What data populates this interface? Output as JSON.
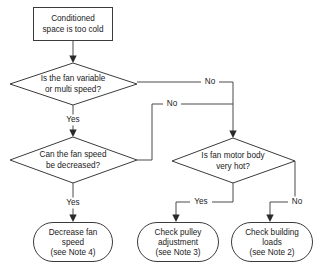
{
  "diagram": {
    "colors": {
      "background": "#ffffff",
      "shape_fill": "#ffffff",
      "shape_stroke": "#3b3b3b",
      "line": "#4a4a4a",
      "text": "#1a1a1a"
    },
    "nodes": {
      "start": {
        "type": "process-box",
        "lines": [
          "Conditioned",
          "space is too cold"
        ]
      },
      "decision_fan_variable": {
        "type": "decision-diamond",
        "lines": [
          "Is the fan variable",
          "or multi speed?"
        ]
      },
      "decision_fan_speed_decrease": {
        "type": "decision-diamond",
        "lines": [
          "Can the fan speed",
          "be decreased?"
        ]
      },
      "decision_motor_hot": {
        "type": "decision-diamond",
        "lines": [
          "Is fan motor body",
          "very hot?"
        ]
      },
      "terminal_decrease_fan_speed": {
        "type": "terminator-rounded",
        "lines": [
          "Decrease fan",
          "speed",
          "(see Note 4)"
        ]
      },
      "terminal_check_pulley": {
        "type": "terminator-rounded",
        "lines": [
          "Check pulley",
          "adjustment",
          "(see Note 3)"
        ]
      },
      "terminal_check_building_loads": {
        "type": "terminator-rounded",
        "lines": [
          "Check building",
          "loads",
          "(see Note 2)"
        ]
      }
    },
    "edge_labels": {
      "fan_variable_no": "No",
      "fan_variable_yes": "Yes",
      "fan_speed_no": "No",
      "fan_speed_yes": "Yes",
      "motor_hot_yes": "Yes",
      "motor_hot_no": "No"
    }
  }
}
